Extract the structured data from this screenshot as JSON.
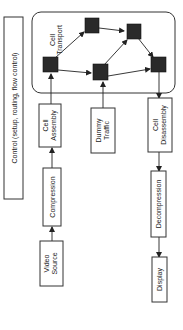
{
  "diagram": {
    "control": {
      "label": "Control (setup, routing, flow control)"
    },
    "cell_transport": {
      "label_line1": "Cell",
      "label_line2": "Transport"
    },
    "boxes": {
      "cell_assembly": {
        "line1": "Cell",
        "line2": "Assembly"
      },
      "dummy_traffic": {
        "line1": "Dummy",
        "line2": "Traffic"
      },
      "cell_disassembly": {
        "line1": "Cell",
        "line2": "Disassembly"
      },
      "compression": {
        "line1": "Compression"
      },
      "decompression": {
        "line1": "Decompression"
      },
      "video_source": {
        "line1": "Video",
        "line2": "Source"
      },
      "display": {
        "line1": "Display"
      }
    },
    "colors": {
      "node": "#2a2a2a",
      "stroke": "#333333",
      "background": "#ffffff"
    }
  }
}
